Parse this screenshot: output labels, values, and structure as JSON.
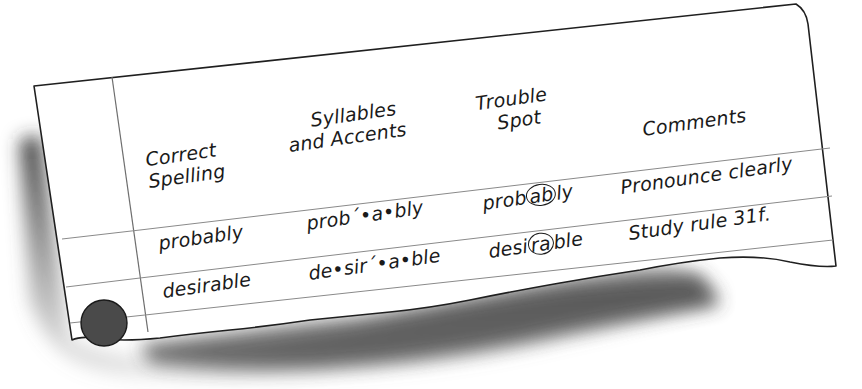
{
  "sheet": {
    "description": "Spelling log sheet on torn notebook paper",
    "paper_color": "#ffffff",
    "line_color": "#6e6e6e",
    "outline_color": "#1f1f1f",
    "hole_color": "#4a4a4a",
    "shadow_color": "#3a3a3a"
  },
  "table": {
    "columns": [
      {
        "header_line1": "Correct",
        "header_line2": "Spelling"
      },
      {
        "header_line1": "Syllables",
        "header_line2": "and Accents"
      },
      {
        "header_line1": "Trouble",
        "header_line2": "Spot"
      },
      {
        "header_line1": "Comments",
        "header_line2": ""
      }
    ],
    "rows": [
      {
        "correct_spelling": "probably",
        "syllables": "prob´•a•bly",
        "trouble_spot": {
          "before": "prob",
          "circled": "ab",
          "after": "ly"
        },
        "comment": "Pronounce clearly"
      },
      {
        "correct_spelling": "desirable",
        "syllables": "de•sir´•a•ble",
        "trouble_spot": {
          "before": "desi",
          "circled": "ra",
          "after": "ble"
        },
        "comment": "Study rule 31f."
      }
    ]
  }
}
